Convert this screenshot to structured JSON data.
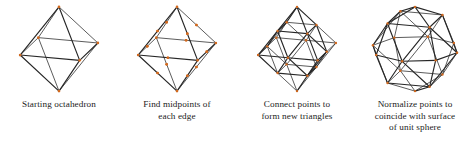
{
  "figure": {
    "background_color": "#ffffff",
    "edge_color": "#262626",
    "vertex_color": "#d2691e",
    "width": 474,
    "height": 141
  },
  "panels": [
    {
      "id": "starting-octahedron",
      "caption_lines": [
        "Starting octahedron"
      ],
      "stage": "base",
      "vertex_count": 6,
      "edge_count": 12,
      "face_count": 8
    },
    {
      "id": "find-midpoints",
      "caption_lines": [
        "Find midpoints of",
        "each edge"
      ],
      "stage": "midpoints",
      "vertex_count": 18,
      "edge_count": 12,
      "face_count": 8
    },
    {
      "id": "connect-points",
      "caption_lines": [
        "Connect points to",
        "form new triangles"
      ],
      "stage": "subdivided",
      "vertex_count": 18,
      "edge_count": 48,
      "face_count": 32
    },
    {
      "id": "normalize-points",
      "caption_lines": [
        "Normalize points to",
        "coincide with surface",
        "of unit sphere"
      ],
      "stage": "normalized",
      "vertex_count": 18,
      "edge_count": 48,
      "face_count": 32
    }
  ],
  "geometry": {
    "octahedron_vertices": [
      [
        0,
        1,
        0
      ],
      [
        0,
        -1,
        0
      ],
      [
        1,
        0,
        0
      ],
      [
        -1,
        0,
        0
      ],
      [
        0,
        0,
        1
      ],
      [
        0,
        0,
        -1
      ]
    ],
    "octahedron_faces": [
      [
        0,
        2,
        4
      ],
      [
        0,
        4,
        3
      ],
      [
        0,
        3,
        5
      ],
      [
        0,
        5,
        2
      ],
      [
        1,
        4,
        2
      ],
      [
        1,
        3,
        4
      ],
      [
        1,
        5,
        3
      ],
      [
        1,
        2,
        5
      ]
    ],
    "projection": {
      "type": "orthographic",
      "yaw_deg": 28,
      "pitch_deg": 17,
      "scale": 44
    }
  }
}
